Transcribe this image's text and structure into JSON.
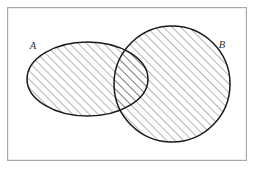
{
  "figure": {
    "type": "venn-diagram",
    "width": 255,
    "height": 169,
    "background_color": "#ffffff"
  },
  "frame": {
    "name": "outer-border",
    "x": 7,
    "y": 7,
    "width": 240,
    "height": 154,
    "stroke_color": "#aaaaaa",
    "stroke_width": 1.2,
    "fill_color": "#ffffff"
  },
  "sets": [
    {
      "id": "A",
      "label": "A",
      "shape": "ellipse",
      "cx": 87.5,
      "cy": 79,
      "rx": 60.5,
      "ry": 37,
      "stroke_color": "#1a1a1a",
      "stroke_width": 1.5,
      "shaded": true,
      "label_x": 33,
      "label_y": 49
    },
    {
      "id": "B",
      "label": "B",
      "shape": "circle",
      "cx": 172,
      "cy": 84,
      "rx": 58,
      "ry": 58,
      "stroke_color": "#1a1a1a",
      "stroke_width": 1.5,
      "shaded": true,
      "label_x": 219,
      "label_y": 48
    }
  ],
  "shading": {
    "name": "diagonal-hatch",
    "description": "45 degree hatch lines rising left to right",
    "line_color": "#2a2a2a",
    "line_width": 0.7,
    "spacing": 6,
    "angle_degrees": 45,
    "region": "A union B"
  },
  "legend": {
    "meaning": "Both sets A and B, including their intersection, are shaded",
    "region_shaded": "A ∪ B"
  }
}
